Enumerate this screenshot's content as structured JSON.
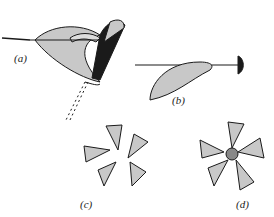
{
  "figure": {
    "panels": [
      {
        "id": "a",
        "label": "(a)",
        "description": "Fruit-like folded petal structure pierced by a thread, with hinged dark bar and dashed trajectory below"
      },
      {
        "id": "b",
        "label": "(b)",
        "description": "Elongated petal on a pin/thread with dark disk head on right"
      },
      {
        "id": "c",
        "label": "(c)",
        "description": "Five separated petals arranged radially"
      },
      {
        "id": "d",
        "label": "(d)",
        "description": "Five petals attached around a central cluster (flower)"
      }
    ],
    "colors": {
      "fill": "#c8c8c8",
      "ink": "#1a1a1a",
      "background": "#ffffff"
    }
  }
}
